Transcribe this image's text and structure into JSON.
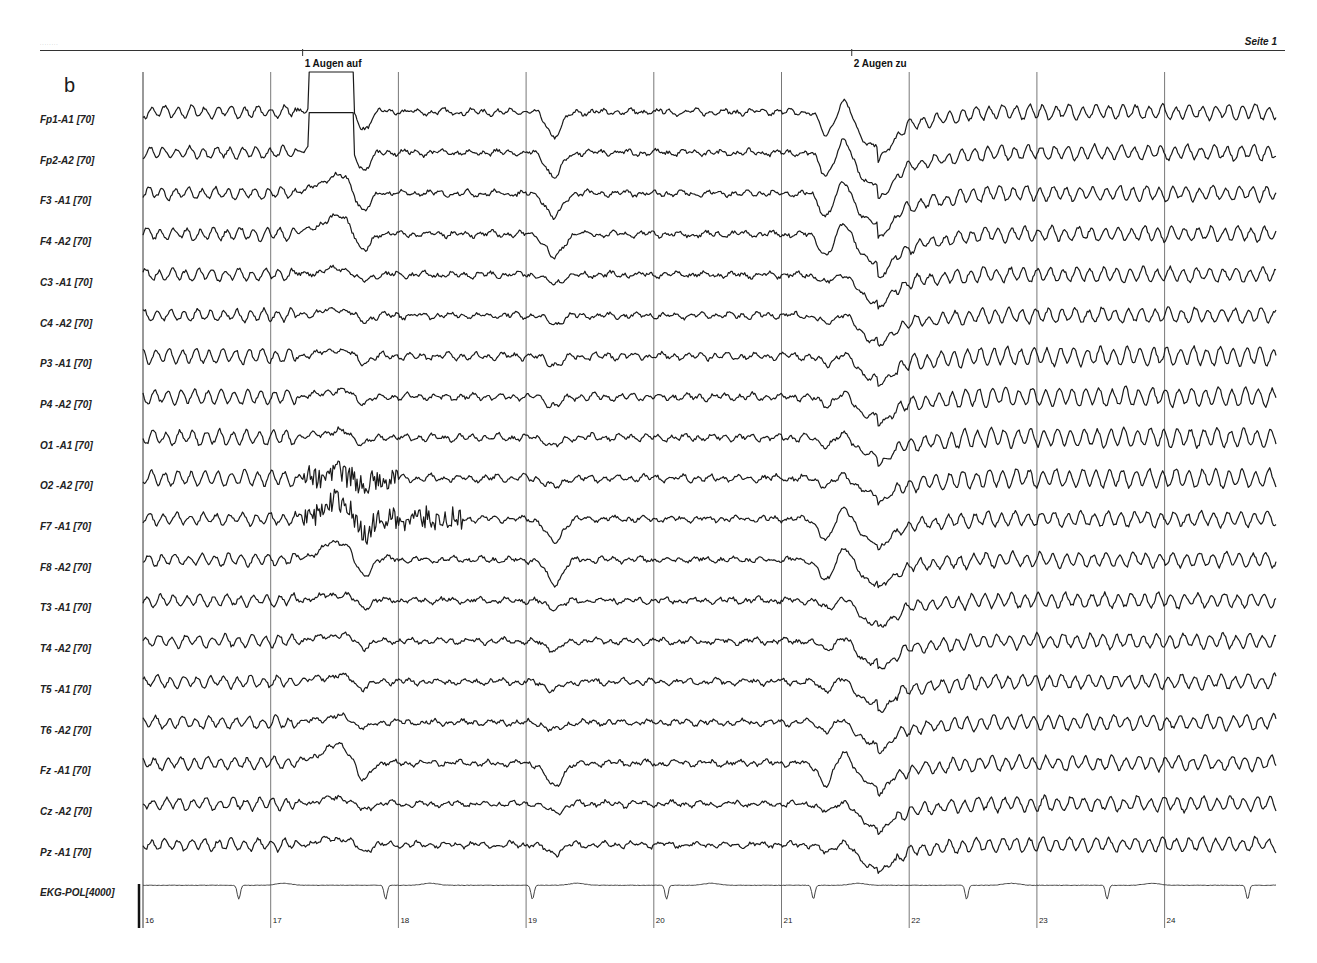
{
  "header": {
    "page_label": "Seite 1",
    "panel_label": "b"
  },
  "markers": [
    {
      "id": "1",
      "label": "1  Augen auf",
      "x_sec": 17.25
    },
    {
      "id": "2",
      "label": "2  Augen zu",
      "x_sec": 21.55
    }
  ],
  "channels": [
    {
      "label": "Fp1-A1 [70]"
    },
    {
      "label": "Fp2-A2 [70]"
    },
    {
      "label": "F3 -A1 [70]"
    },
    {
      "label": "F4 -A2 [70]"
    },
    {
      "label": "C3 -A1 [70]"
    },
    {
      "label": "C4 -A2 [70]"
    },
    {
      "label": "P3 -A1 [70]"
    },
    {
      "label": "P4 -A2 [70]"
    },
    {
      "label": "O1 -A1 [70]"
    },
    {
      "label": "O2 -A2 [70]"
    },
    {
      "label": "F7 -A1 [70]"
    },
    {
      "label": "F8 -A2 [70]"
    },
    {
      "label": "T3 -A1 [70]"
    },
    {
      "label": "T4 -A2 [70]"
    },
    {
      "label": "T5 -A1 [70]"
    },
    {
      "label": "T6 -A2 [70]"
    },
    {
      "label": "Fz -A1 [70]"
    },
    {
      "label": "Cz -A2 [70]"
    },
    {
      "label": "Pz -A1 [70]"
    },
    {
      "label": "EKG-POL[4000]"
    }
  ],
  "time_ticks": [
    "16",
    "17",
    "18",
    "19",
    "20",
    "21",
    "22",
    "23",
    "24"
  ],
  "chart_data": {
    "type": "line",
    "xlabel": "Time (s)",
    "ylabel": "Channel",
    "x_range": [
      16,
      24.95
    ],
    "x_ticks": [
      16,
      17,
      18,
      19,
      20,
      21,
      22,
      23,
      24
    ],
    "grid": "vertical lines at each second",
    "series": [
      {
        "name": "Fp1-A1 [70]",
        "events": [
          "large eye-blink saturation ~17.3-17.6s",
          "dip ~17.7s",
          "dip ~19.2s",
          "blink ~21.3-21.5s",
          "large slow dip ~21.7s"
        ]
      },
      {
        "name": "Fp2-A2 [70]",
        "events": [
          "eye-open artifact 17.3-17.8s",
          "step ~18.5s",
          "dip ~19.2s",
          "dip ~21.3s",
          "slow dip ~21.7s"
        ]
      },
      {
        "name": "F3 -A1 [70]",
        "events": [
          "artifact ~17.5s",
          "dip ~19.2s",
          "dip ~21.7s"
        ]
      },
      {
        "name": "F4 -A2 [70]",
        "events": [
          "dip ~17.7s",
          "dip ~21.4s",
          "dip ~21.7s"
        ]
      },
      {
        "name": "C3 -A1 [70]",
        "events": [
          "alpha rhythm before 17s and after 22s",
          "dip ~21.7s"
        ]
      },
      {
        "name": "C4 -A2 [70]",
        "events": [
          "alpha rhythm",
          "dip ~21.7s"
        ]
      },
      {
        "name": "P3 -A1 [70]",
        "events": [
          "alpha rhythm",
          "dip ~21.7s"
        ]
      },
      {
        "name": "P4 -A2 [70]",
        "events": [
          "alpha rhythm",
          "dip ~21.7s"
        ]
      },
      {
        "name": "O1 -A1 [70]",
        "events": [
          "prominent alpha after eyes closed"
        ]
      },
      {
        "name": "O2 -A2 [70]",
        "events": [
          "muscle artifact 17.2-18.0s",
          "prominent alpha after 23s"
        ]
      },
      {
        "name": "F7 -A1 [70]",
        "events": [
          "muscle artifact 17.2-18.5s",
          "dip ~19.2s",
          "dip ~21.3s"
        ]
      },
      {
        "name": "F8 -A2 [70]",
        "events": [
          "dip ~17.7s",
          "dip ~19.2s",
          "dip ~21.4s",
          "dip ~21.7s"
        ]
      },
      {
        "name": "T3 -A1 [70]",
        "events": [
          "dip ~21.7s"
        ]
      },
      {
        "name": "T4 -A2 [70]",
        "events": [
          "dip ~21.7s"
        ]
      },
      {
        "name": "T5 -A1 [70]",
        "events": [
          "dip ~21.7s"
        ]
      },
      {
        "name": "T6 -A2 [70]",
        "events": [
          "dip ~17.7s",
          "dip ~21.7s"
        ]
      },
      {
        "name": "Fz -A1 [70]",
        "events": [
          "dip ~17.7s",
          "dip ~19.2s",
          "dip ~21.4s",
          "dip ~21.7s"
        ]
      },
      {
        "name": "Cz -A2 [70]",
        "events": [
          "dip ~21.7s"
        ]
      },
      {
        "name": "Pz -A1 [70]",
        "events": [
          "dip ~21.7s"
        ]
      },
      {
        "name": "EKG-POL[4000]",
        "qrs_times_s": [
          16.75,
          17.9,
          19.05,
          20.1,
          21.25,
          22.45,
          23.55,
          24.65
        ]
      }
    ]
  }
}
